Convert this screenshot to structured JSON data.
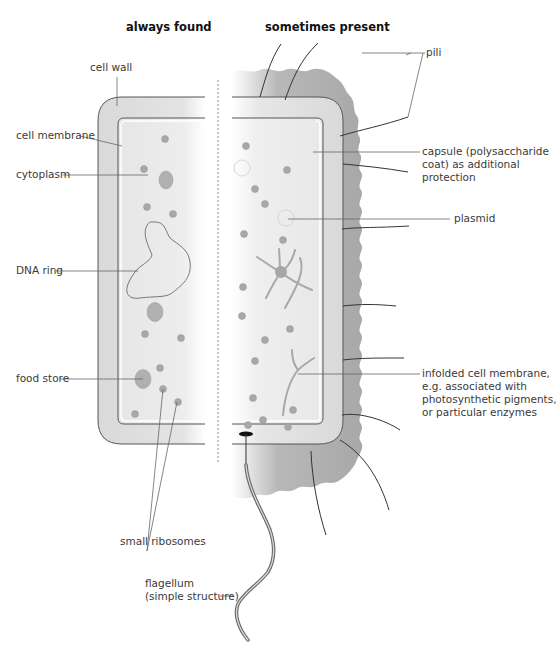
{
  "diagram": {
    "headings": {
      "left": "always found",
      "right": "sometimes present"
    },
    "labels_left": {
      "cell_wall": "cell wall",
      "cell_membrane": "cell membrane",
      "cytoplasm": "cytoplasm",
      "dna_ring": "DNA ring",
      "food_store": "food store",
      "small_ribosomes": "small ribosomes",
      "flagellum_line1": "flagellum",
      "flagellum_line2": "(simple structure)"
    },
    "labels_right": {
      "pili": "pili",
      "capsule_line1": "capsule (polysaccharide",
      "capsule_line2": "coat) as additional",
      "capsule_line3": "protection",
      "plasmid": "plasmid",
      "infolded_line1": "infolded cell membrane,",
      "infolded_line2": "e.g. associated with",
      "infolded_line3": "photosynthetic pigments,",
      "infolded_line4": "or particular enzymes"
    },
    "colors": {
      "cell_wall": "#d9d9d9",
      "cytoplasm": "#ececec",
      "capsule": "#a9a9a9",
      "ribosome": "#a6a6a6",
      "outline": "#555555",
      "leader_line": "#666666"
    }
  }
}
